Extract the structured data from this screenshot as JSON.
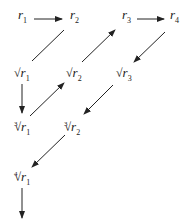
{
  "diagram": {
    "title": "",
    "nodes": [
      {
        "id": "r1",
        "root": "",
        "index": "",
        "base": "r",
        "sub": "1",
        "x": 18,
        "y": 8
      },
      {
        "id": "r2",
        "root": "",
        "index": "",
        "base": "r",
        "sub": "2",
        "x": 70,
        "y": 8
      },
      {
        "id": "r3",
        "root": "",
        "index": "",
        "base": "r",
        "sub": "3",
        "x": 122,
        "y": 8
      },
      {
        "id": "r4",
        "root": "",
        "index": "",
        "base": "r",
        "sub": "4",
        "x": 170,
        "y": 8
      },
      {
        "id": "sqrt_r1",
        "root": "√",
        "index": "",
        "base": "r",
        "sub": "1",
        "x": 14,
        "y": 66
      },
      {
        "id": "sqrt_r2",
        "root": "√",
        "index": "",
        "base": "r",
        "sub": "2",
        "x": 66,
        "y": 66
      },
      {
        "id": "sqrt_r3",
        "root": "√",
        "index": "",
        "base": "r",
        "sub": "3",
        "x": 116,
        "y": 66
      },
      {
        "id": "cbrt_r1",
        "root": "√",
        "index": "3",
        "base": "r",
        "sub": "1",
        "x": 14,
        "y": 120
      },
      {
        "id": "cbrt_r2",
        "root": "√",
        "index": "3",
        "base": "r",
        "sub": "2",
        "x": 64,
        "y": 120
      },
      {
        "id": "qrt_r1",
        "root": "√",
        "index": "4",
        "base": "r",
        "sub": "1",
        "x": 14,
        "y": 170
      }
    ],
    "edges": [
      {
        "from": "r1",
        "to": "r2",
        "arrow": true
      },
      {
        "from": "r2",
        "to": "sqrt_r1",
        "arrow": false
      },
      {
        "from": "sqrt_r1",
        "to": "cbrt_r1",
        "arrow": true
      },
      {
        "from": "cbrt_r1",
        "to": "sqrt_r2",
        "arrow": true
      },
      {
        "from": "sqrt_r2",
        "to": "r3",
        "arrow": true
      },
      {
        "from": "r3",
        "to": "r4",
        "arrow": true
      },
      {
        "from": "r4",
        "to": "sqrt_r3",
        "arrow": true
      },
      {
        "from": "sqrt_r3",
        "to": "cbrt_r2",
        "arrow": true
      },
      {
        "from": "cbrt_r2",
        "to": "qrt_r1",
        "arrow": true
      },
      {
        "from": "qrt_r1",
        "to": "down",
        "arrow": true
      }
    ]
  }
}
